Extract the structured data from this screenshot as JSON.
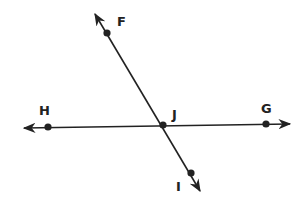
{
  "diagram": {
    "type": "intersecting-lines",
    "colors": {
      "ink": "#222222",
      "background": "#ffffff"
    },
    "lines": [
      {
        "name": "line-HG",
        "through": [
          "H",
          "J",
          "G"
        ],
        "arrows": "both"
      },
      {
        "name": "line-FI",
        "through": [
          "F",
          "J",
          "I"
        ],
        "arrows": "both"
      }
    ],
    "points": [
      {
        "label": "F",
        "x": 107,
        "y": 33,
        "label_x": 117,
        "label_y": 26
      },
      {
        "label": "H",
        "x": 48,
        "y": 127,
        "label_x": 39,
        "label_y": 115
      },
      {
        "label": "J",
        "x": 163,
        "y": 125,
        "label_x": 172,
        "label_y": 118
      },
      {
        "label": "G",
        "x": 266,
        "y": 124,
        "label_x": 262,
        "label_y": 113
      },
      {
        "label": "I",
        "x": 191,
        "y": 173,
        "label_x": 176,
        "label_y": 191
      }
    ]
  }
}
